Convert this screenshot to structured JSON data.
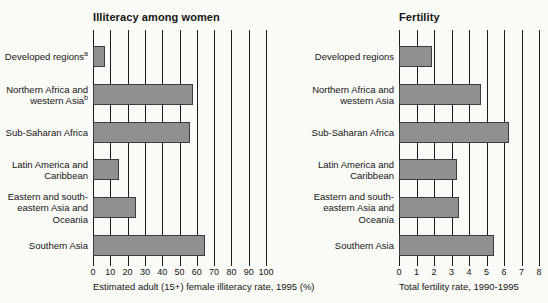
{
  "style": {
    "background": "#fafaf7",
    "bar_fill": "#909090",
    "bar_border": "#3c3c3c",
    "grid_color": "#1c1c1c",
    "text_color": "#151515"
  },
  "chart_data": [
    {
      "type": "bar",
      "orientation": "horizontal",
      "title": "Illiteracy among women",
      "xlabel": "Estimated adult (15+) female illiteracy rate, 1995 (%)",
      "xlim": [
        0,
        100
      ],
      "xticks": [
        0,
        10,
        20,
        30,
        40,
        50,
        60,
        70,
        80,
        90,
        100
      ],
      "grid": true,
      "legend": null,
      "categories": [
        {
          "lines": [
            "Developed regions"
          ],
          "sup": "a"
        },
        {
          "lines": [
            "Northern Africa and",
            "western Asia"
          ],
          "sup": "b"
        },
        {
          "lines": [
            "Sub-Saharan Africa"
          ],
          "sup": ""
        },
        {
          "lines": [
            "Latin America and",
            "Caribbean"
          ],
          "sup": ""
        },
        {
          "lines": [
            "Eastern and south-",
            "eastern Asia and",
            "Oceania"
          ],
          "sup": ""
        },
        {
          "lines": [
            "Southern Asia"
          ],
          "sup": ""
        }
      ],
      "values": [
        7,
        58,
        56,
        15,
        25,
        65
      ]
    },
    {
      "type": "bar",
      "orientation": "horizontal",
      "title": "Fertility",
      "xlabel": "Total fertility rate, 1990-1995",
      "xlim": [
        0,
        8
      ],
      "xticks": [
        0,
        1,
        2,
        3,
        4,
        5,
        6,
        7,
        8
      ],
      "grid": true,
      "legend": null,
      "categories": [
        {
          "lines": [
            "Developed regions"
          ],
          "sup": ""
        },
        {
          "lines": [
            "Northern Africa and",
            "western Asia"
          ],
          "sup": ""
        },
        {
          "lines": [
            "Sub-Saharan Africa"
          ],
          "sup": ""
        },
        {
          "lines": [
            "Latin America and",
            "Caribbean"
          ],
          "sup": ""
        },
        {
          "lines": [
            "Eastern and south-",
            "eastern Asia and",
            "Oceania"
          ],
          "sup": ""
        },
        {
          "lines": [
            "Southern Asia"
          ],
          "sup": ""
        }
      ],
      "values": [
        1.9,
        4.7,
        6.3,
        3.3,
        3.4,
        5.4
      ]
    }
  ]
}
